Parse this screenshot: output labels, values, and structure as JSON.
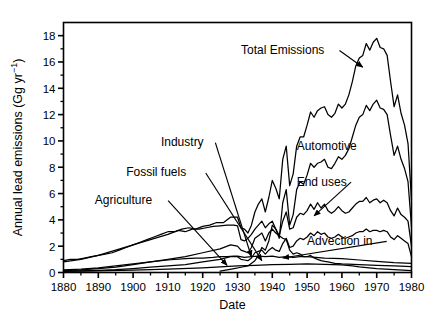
{
  "chart_data": {
    "type": "line",
    "title": "",
    "xlabel": "Date",
    "ylabel": "Annual lead emissions (Gg yr⁻¹)",
    "xlim": [
      1880,
      1980
    ],
    "ylim": [
      0,
      19
    ],
    "xticks": [
      1880,
      1890,
      1900,
      1910,
      1920,
      1930,
      1940,
      1950,
      1960,
      1970,
      1980
    ],
    "yticks": [
      0,
      2,
      4,
      6,
      8,
      10,
      12,
      14,
      16,
      18
    ],
    "yminorticks": [
      1,
      3,
      5,
      7,
      9,
      11,
      13,
      15,
      17
    ],
    "grid": false,
    "legend": "none",
    "annotations": [
      {
        "text": "Total Emissions",
        "x": 1931,
        "y": 16.6,
        "arrow_to_x": 1966,
        "arrow_to_y": 15.6
      },
      {
        "text": "Industry",
        "x": 1908,
        "y": 9.6,
        "arrow_to_x": 1934,
        "arrow_to_y": 1.2
      },
      {
        "text": "Fossil fuels",
        "x": 1898,
        "y": 7.3,
        "arrow_to_x": 1937,
        "arrow_to_y": 0.9
      },
      {
        "text": "Agriculture",
        "x": 1889,
        "y": 5.2,
        "arrow_to_x": 1927,
        "arrow_to_y": 0.55
      },
      {
        "text": "Automotive",
        "x": 1947,
        "y": 9.3
      },
      {
        "text": "End uses",
        "x": 1947,
        "y": 6.6,
        "arrow_to_x": 1952,
        "arrow_to_y": 4.3
      },
      {
        "text": "Advection in",
        "x": 1950,
        "y": 2.1,
        "arrow_to_x": 1943,
        "arrow_to_y": 1.1
      }
    ],
    "series": [
      {
        "name": "Total Emissions",
        "x": [
          1880,
          1882,
          1884,
          1886,
          1888,
          1890,
          1892,
          1894,
          1896,
          1898,
          1900,
          1902,
          1904,
          1906,
          1908,
          1910,
          1912,
          1914,
          1916,
          1918,
          1920,
          1922,
          1924,
          1926,
          1928,
          1930,
          1931,
          1932,
          1933,
          1934,
          1935,
          1936,
          1937,
          1938,
          1939,
          1940,
          1941,
          1942,
          1943,
          1944,
          1945,
          1946,
          1947,
          1948,
          1949,
          1950,
          1951,
          1952,
          1953,
          1954,
          1955,
          1956,
          1957,
          1958,
          1959,
          1960,
          1961,
          1962,
          1963,
          1964,
          1965,
          1966,
          1967,
          1968,
          1969,
          1970,
          1971,
          1972,
          1973,
          1974,
          1975,
          1976,
          1977,
          1978,
          1979,
          1980
        ],
        "y": [
          0.9,
          1.0,
          1.0,
          1.1,
          1.2,
          1.3,
          1.4,
          1.5,
          1.7,
          1.9,
          2.1,
          2.3,
          2.5,
          2.7,
          2.9,
          3.1,
          3.1,
          3.3,
          3.4,
          3.3,
          3.5,
          3.6,
          3.8,
          3.8,
          4.2,
          4.2,
          3.4,
          3.3,
          3.0,
          3.6,
          4.6,
          5.2,
          5.6,
          4.6,
          5.7,
          7.0,
          6.4,
          5.6,
          8.6,
          9.6,
          6.6,
          7.5,
          9.6,
          10.3,
          10.3,
          11.2,
          12.2,
          11.8,
          12.3,
          12.5,
          12.6,
          12.0,
          11.8,
          12.1,
          12.8,
          12.5,
          12.8,
          13.5,
          14.5,
          15.7,
          16.3,
          16.5,
          17.4,
          16.9,
          17.5,
          17.8,
          17.1,
          17.0,
          16.5,
          14.5,
          12.6,
          13.5,
          12.1,
          11.2,
          9.8,
          5.5
        ]
      },
      {
        "name": "Automotive",
        "x": [
          1925,
          1927,
          1929,
          1931,
          1933,
          1935,
          1936,
          1937,
          1938,
          1939,
          1940,
          1941,
          1942,
          1943,
          1944,
          1945,
          1946,
          1947,
          1948,
          1949,
          1950,
          1951,
          1952,
          1953,
          1954,
          1955,
          1956,
          1957,
          1958,
          1959,
          1960,
          1961,
          1962,
          1963,
          1964,
          1965,
          1966,
          1967,
          1968,
          1969,
          1970,
          1971,
          1972,
          1973,
          1974,
          1975,
          1976,
          1977,
          1978,
          1979,
          1980
        ],
        "y": [
          0.1,
          0.2,
          0.3,
          0.4,
          0.5,
          0.9,
          1.3,
          1.9,
          1.7,
          2.4,
          3.6,
          3.3,
          2.6,
          5.3,
          6.3,
          3.6,
          4.4,
          6.3,
          6.9,
          6.7,
          7.4,
          8.3,
          8.0,
          8.3,
          8.4,
          8.6,
          8.0,
          7.9,
          8.3,
          8.8,
          8.6,
          8.9,
          9.4,
          10.3,
          11.2,
          11.8,
          12.0,
          12.7,
          12.3,
          12.8,
          13.1,
          12.5,
          12.4,
          12.0,
          10.4,
          8.9,
          9.6,
          8.6,
          7.9,
          6.9,
          3.5
        ]
      },
      {
        "name": "End uses",
        "x": [
          1880,
          1885,
          1890,
          1895,
          1900,
          1905,
          1910,
          1915,
          1920,
          1925,
          1928,
          1930,
          1931,
          1932,
          1933,
          1934,
          1935,
          1936,
          1937,
          1938,
          1939,
          1940,
          1941,
          1942,
          1943,
          1944,
          1945,
          1946,
          1947,
          1948,
          1949,
          1950,
          1951,
          1952,
          1953,
          1954,
          1955,
          1956,
          1957,
          1958,
          1959,
          1960,
          1961,
          1962,
          1963,
          1964,
          1965,
          1966,
          1967,
          1968,
          1969,
          1970,
          1971,
          1972,
          1973,
          1974,
          1975,
          1976,
          1977,
          1978,
          1979,
          1980
        ],
        "y": [
          0.15,
          0.2,
          0.3,
          0.4,
          0.6,
          0.8,
          1.0,
          1.2,
          1.5,
          1.8,
          2.1,
          2.0,
          1.7,
          1.6,
          1.5,
          1.9,
          2.6,
          2.8,
          3.0,
          2.4,
          3.0,
          3.3,
          3.0,
          2.8,
          3.9,
          4.6,
          3.3,
          3.4,
          4.2,
          4.5,
          4.4,
          4.7,
          5.2,
          4.8,
          5.3,
          4.9,
          5.2,
          4.7,
          4.5,
          4.7,
          5.0,
          4.7,
          4.5,
          4.6,
          4.9,
          5.2,
          5.4,
          5.4,
          5.7,
          5.3,
          5.5,
          5.6,
          5.3,
          5.5,
          5.3,
          4.7,
          4.3,
          4.9,
          4.4,
          4.2,
          3.9,
          2.0
        ]
      },
      {
        "name": "Advection in",
        "x": [
          1880,
          1885,
          1890,
          1895,
          1900,
          1905,
          1910,
          1915,
          1920,
          1925,
          1928,
          1930,
          1931,
          1932,
          1933,
          1934,
          1935,
          1936,
          1937,
          1938,
          1939,
          1940,
          1941,
          1942,
          1943,
          1944,
          1945,
          1946,
          1947,
          1948,
          1949,
          1950,
          1951,
          1952,
          1953,
          1954,
          1955,
          1956,
          1957,
          1958,
          1959,
          1960,
          1961,
          1962,
          1963,
          1964,
          1965,
          1966,
          1967,
          1968,
          1969,
          1970,
          1971,
          1972,
          1973,
          1974,
          1975,
          1976,
          1977,
          1978,
          1979,
          1980
        ],
        "y": [
          0.1,
          0.13,
          0.17,
          0.22,
          0.3,
          0.4,
          0.5,
          0.6,
          0.8,
          1.0,
          1.2,
          1.2,
          1.0,
          0.95,
          0.9,
          1.1,
          1.5,
          1.6,
          1.7,
          1.4,
          1.7,
          1.9,
          1.7,
          1.6,
          2.2,
          2.6,
          1.9,
          2.0,
          2.4,
          2.6,
          2.5,
          2.7,
          3.0,
          2.8,
          3.1,
          2.9,
          3.0,
          2.7,
          2.6,
          2.7,
          2.9,
          2.7,
          2.6,
          2.7,
          2.8,
          3.0,
          3.1,
          3.1,
          3.3,
          3.1,
          3.2,
          3.2,
          3.1,
          3.2,
          3.1,
          2.7,
          2.5,
          2.8,
          2.6,
          2.4,
          2.2,
          1.2
        ]
      },
      {
        "name": "Industry",
        "x": [
          1880,
          1885,
          1890,
          1895,
          1900,
          1905,
          1910,
          1913,
          1915,
          1917,
          1919,
          1921,
          1923,
          1925,
          1927,
          1929,
          1930,
          1931,
          1932,
          1933,
          1934,
          1935,
          1936,
          1937,
          1938,
          1939,
          1940,
          1941,
          1942,
          1943,
          1944,
          1945,
          1946,
          1947,
          1948,
          1949,
          1950,
          1951,
          1952,
          1953,
          1954,
          1955,
          1956,
          1957,
          1958,
          1959,
          1960,
          1965,
          1970,
          1975,
          1980
        ],
        "y": [
          0.8,
          1.0,
          1.3,
          1.7,
          2.1,
          2.5,
          2.9,
          3.2,
          3.1,
          3.3,
          3.3,
          3.4,
          3.5,
          3.55,
          3.6,
          3.6,
          3.55,
          2.5,
          2.4,
          2.6,
          2.9,
          3.3,
          3.6,
          3.9,
          3.4,
          3.7,
          3.9,
          3.3,
          2.8,
          2.6,
          2.5,
          1.7,
          1.4,
          1.5,
          1.4,
          1.2,
          1.2,
          1.3,
          1.1,
          1.0,
          0.9,
          0.85,
          0.8,
          0.75,
          0.7,
          0.68,
          0.65,
          0.6,
          0.55,
          0.5,
          0.45
        ]
      },
      {
        "name": "Fossil fuels",
        "x": [
          1880,
          1885,
          1890,
          1895,
          1900,
          1905,
          1910,
          1915,
          1918,
          1920,
          1923,
          1925,
          1927,
          1929,
          1930,
          1932,
          1934,
          1936,
          1938,
          1940,
          1942,
          1944,
          1946,
          1948,
          1950,
          1955,
          1960,
          1965,
          1970,
          1975,
          1980
        ],
        "y": [
          0.2,
          0.25,
          0.35,
          0.5,
          0.65,
          0.8,
          0.95,
          1.05,
          1.1,
          1.1,
          1.15,
          1.2,
          1.2,
          1.25,
          1.25,
          1.15,
          1.2,
          1.25,
          1.2,
          1.25,
          1.15,
          1.2,
          1.15,
          1.2,
          1.2,
          1.1,
          1.05,
          0.95,
          0.85,
          0.75,
          0.7
        ]
      },
      {
        "name": "Agriculture",
        "x": [
          1880,
          1890,
          1900,
          1910,
          1920,
          1925,
          1930,
          1935,
          1940,
          1945,
          1950,
          1955,
          1960,
          1963,
          1965,
          1970,
          1975,
          1980
        ],
        "y": [
          0.08,
          0.12,
          0.18,
          0.25,
          0.35,
          0.42,
          0.5,
          0.55,
          0.6,
          0.62,
          0.65,
          0.62,
          0.58,
          0.5,
          0.42,
          0.3,
          0.22,
          0.15
        ]
      }
    ]
  },
  "axis": {
    "ylabel": "Annual lead emissions (Gg yr⁻¹)",
    "ylabel_main": "Annual lead emissions (Gg yr",
    "ylabel_sup": "−1",
    "ylabel_tail": ")",
    "xlabel": "Date"
  },
  "labels": {
    "total_emissions": "Total Emissions",
    "industry": "Industry",
    "fossil_fuels": "Fossil fuels",
    "agriculture": "Agriculture",
    "automotive": "Automotive",
    "end_uses": "End uses",
    "advection_in": "Advection in"
  },
  "ticks": {
    "x": [
      "1880",
      "1890",
      "1900",
      "1910",
      "1920",
      "1930",
      "1940",
      "1950",
      "1960",
      "1970",
      "1980"
    ],
    "y": [
      "0",
      "2",
      "4",
      "6",
      "8",
      "10",
      "12",
      "14",
      "16",
      "18"
    ]
  },
  "colors": {
    "line": "#000000",
    "axis": "#000000",
    "background": "#ffffff"
  }
}
